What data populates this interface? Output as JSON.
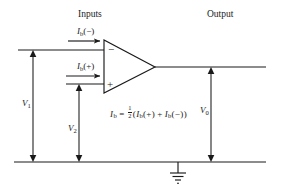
{
  "figure": {
    "title_inputs": "Inputs",
    "title_output": "Output"
  },
  "labels": {
    "bias_minus": {
      "symbol": "I",
      "subscript": "b",
      "arg": "(−)"
    },
    "bias_plus": {
      "symbol": "I",
      "subscript": "b",
      "arg": "(+)"
    },
    "v1": {
      "symbol": "V",
      "subscript": "1"
    },
    "v2": {
      "symbol": "V",
      "subscript": "2"
    },
    "v0": {
      "symbol": "V",
      "subscript": "0"
    },
    "terminal_inverting": "−",
    "terminal_noninverting": "+"
  },
  "equation": {
    "lhs_symbol": "I",
    "lhs_subscript": "b",
    "equals": "=",
    "fraction_numerator": "1",
    "fraction_denominator": "2",
    "open_paren": "(",
    "term1_symbol": "I",
    "term1_subscript": "b",
    "term1_arg": "(+)",
    "plus": "+",
    "term2_symbol": "I",
    "term2_subscript": "b",
    "term2_arg": "(−)",
    "close_paren": ")",
    "full_text": "I_b = 1/2 (I_b(+) + I_b(−))"
  },
  "icons": {
    "ground": "ground-symbol",
    "opamp": "opamp-triangle",
    "arrow_current_minus": "current-arrow-right",
    "arrow_current_plus": "current-arrow-right"
  },
  "colors": {
    "line": "#1a1a1a",
    "background": "#ffffff",
    "text": "#1a1a1a"
  }
}
